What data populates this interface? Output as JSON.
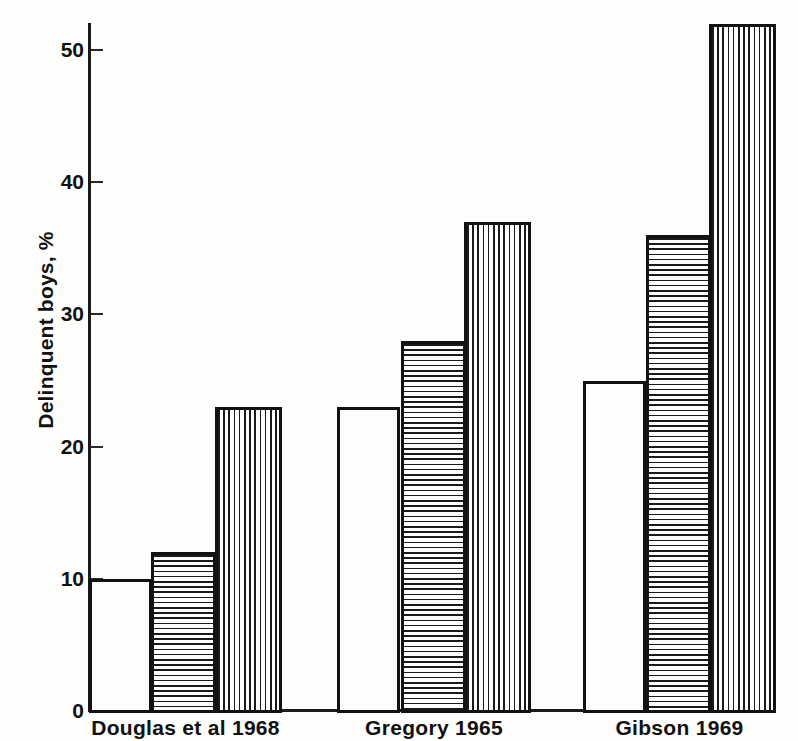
{
  "chart_data": {
    "type": "bar",
    "title": "",
    "subtitle": "",
    "xlabel": "",
    "ylabel": "Delinquent boys, %",
    "ylim": [
      0,
      54
    ],
    "yticks": [
      0,
      10,
      20,
      30,
      40,
      50
    ],
    "ytick_labels": [
      "0",
      "10",
      "20",
      "30",
      "40",
      "50"
    ],
    "grid": false,
    "legend": false,
    "legend_position": "none",
    "categories": [
      "Douglas et al 1968",
      "Gregory 1965",
      "Gibson 1969"
    ],
    "series": [
      {
        "name": "bar-1",
        "pattern": "blank",
        "values": [
          10,
          23,
          25
        ]
      },
      {
        "name": "bar-2",
        "pattern": "horizontal-stripes",
        "values": [
          12,
          28,
          36
        ]
      },
      {
        "name": "bar-3",
        "pattern": "vertical-stripes",
        "values": [
          23,
          37,
          52
        ]
      }
    ],
    "colors": {
      "ink": "#121212",
      "background": "#fdfdfc"
    }
  },
  "axis": {
    "y_title": "Delinquent boys, %",
    "ticks": [
      {
        "label": "50",
        "value": 50
      },
      {
        "label": "40",
        "value": 40
      },
      {
        "label": "30",
        "value": 30
      },
      {
        "label": "20",
        "value": 20
      },
      {
        "label": "10",
        "value": 10
      },
      {
        "label": "0",
        "value": 0
      }
    ]
  },
  "groups": [
    {
      "label": "Douglas et al 1968",
      "bars": [
        {
          "value": 10,
          "pattern": "blank"
        },
        {
          "value": 12,
          "pattern": "horizontal-stripes"
        },
        {
          "value": 23,
          "pattern": "vertical-stripes"
        }
      ]
    },
    {
      "label": "Gregory 1965",
      "bars": [
        {
          "value": 23,
          "pattern": "blank"
        },
        {
          "value": 28,
          "pattern": "horizontal-stripes"
        },
        {
          "value": 37,
          "pattern": "vertical-stripes"
        }
      ]
    },
    {
      "label": "Gibson 1969",
      "bars": [
        {
          "value": 25,
          "pattern": "blank"
        },
        {
          "value": 36,
          "pattern": "horizontal-stripes"
        },
        {
          "value": 52,
          "pattern": "vertical-stripes"
        }
      ]
    }
  ]
}
